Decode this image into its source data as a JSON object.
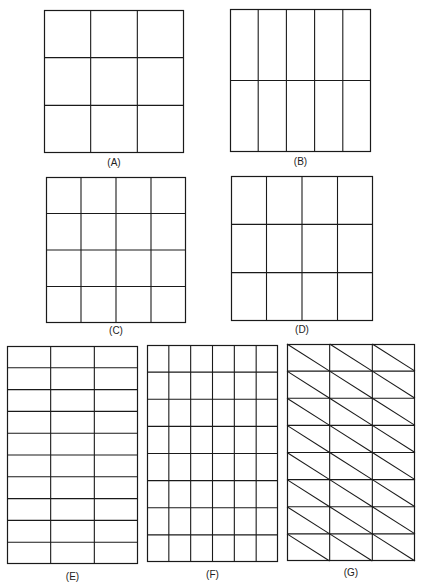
{
  "figure": {
    "stroke_color": "#1a1a1a",
    "grids": [
      {
        "id": "A",
        "label": "(A)",
        "cols": 3,
        "rows": 3,
        "diagonals": false,
        "x": 44,
        "y": 10,
        "w": 140,
        "h": 143,
        "label_y": 157
      },
      {
        "id": "B",
        "label": "(B)",
        "cols": 5,
        "rows": 2,
        "diagonals": false,
        "x": 230,
        "y": 9,
        "w": 141,
        "h": 143,
        "label_y": 156
      },
      {
        "id": "C",
        "label": "(C)",
        "cols": 4,
        "rows": 4,
        "diagonals": false,
        "x": 46,
        "y": 177,
        "w": 140,
        "h": 146,
        "label_y": 325
      },
      {
        "id": "D",
        "label": "(D)",
        "cols": 4,
        "rows": 3,
        "diagonals": false,
        "x": 231,
        "y": 176,
        "w": 142,
        "h": 145,
        "label_y": 324
      },
      {
        "id": "E",
        "label": "(E)",
        "cols": 3,
        "rows": 10,
        "diagonals": false,
        "x": 7,
        "y": 346,
        "w": 131,
        "h": 218,
        "label_y": 571
      },
      {
        "id": "F",
        "label": "(F)",
        "cols": 6,
        "rows": 8,
        "diagonals": false,
        "x": 147,
        "y": 345,
        "w": 131,
        "h": 217,
        "label_y": 569
      },
      {
        "id": "G",
        "label": "(G)",
        "cols": 3,
        "rows": 8,
        "diagonals": true,
        "x": 287,
        "y": 344,
        "w": 128,
        "h": 217,
        "label_y": 567
      }
    ]
  }
}
